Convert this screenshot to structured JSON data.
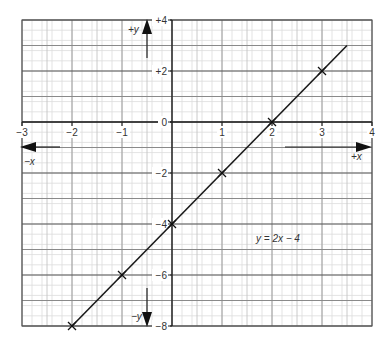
{
  "chart_data": {
    "type": "line",
    "title": "",
    "equation_label": "y = 2x − 4",
    "xlabel_pos": "+x",
    "xlabel_neg": "−x",
    "ylabel_pos": "+y",
    "ylabel_neg": "−y",
    "xlim": [
      -3,
      4
    ],
    "ylim": [
      -8,
      4
    ],
    "x_ticks": [
      -3,
      -2,
      -1,
      0,
      1,
      2,
      3,
      4
    ],
    "x_tick_labels": [
      "−3",
      "−2",
      "−1",
      "",
      "1",
      "2",
      "3",
      "4"
    ],
    "y_ticks": [
      4,
      2,
      0,
      -2,
      -4,
      -6,
      -8
    ],
    "y_tick_labels": [
      "+4",
      "+2",
      "0",
      "−2",
      "−4",
      "−6",
      "−8"
    ],
    "grid": true,
    "series": [
      {
        "name": "y = 2x − 4",
        "line": {
          "x_start": -2,
          "y_start": -8,
          "x_end": 3.5,
          "y_end": 3
        },
        "marked_points": [
          {
            "x": -2,
            "y": -8
          },
          {
            "x": -1,
            "y": -6
          },
          {
            "x": 0,
            "y": -4
          },
          {
            "x": 1,
            "y": -2
          },
          {
            "x": 2,
            "y": 0
          },
          {
            "x": 3,
            "y": 2
          }
        ]
      }
    ]
  }
}
